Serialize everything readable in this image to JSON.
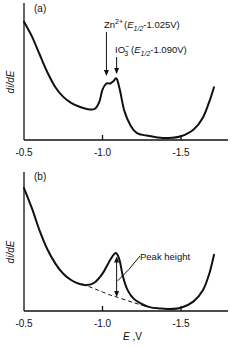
{
  "chart_data": [
    {
      "type": "line",
      "panel_label": "(a)",
      "title": "",
      "xlabel": "",
      "ylabel": "di/dE",
      "xlim": [
        -0.5,
        -1.75
      ],
      "ylim": [
        0,
        1
      ],
      "xticks": [
        -0.5,
        -1.0,
        -1.5
      ],
      "xtick_labels": [
        "-0.5",
        "-1.0",
        "-1.5"
      ],
      "grid": false,
      "series": [
        {
          "name": "differential pulse polarogram",
          "x": [
            -0.5,
            -0.55,
            -0.6,
            -0.65,
            -0.7,
            -0.75,
            -0.8,
            -0.85,
            -0.9,
            -0.95,
            -0.98,
            -1.0,
            -1.025,
            -1.05,
            -1.07,
            -1.09,
            -1.11,
            -1.14,
            -1.18,
            -1.22,
            -1.28,
            -1.35,
            -1.42,
            -1.5,
            -1.58,
            -1.64,
            -1.68,
            -1.71
          ],
          "y": [
            0.96,
            0.84,
            0.69,
            0.54,
            0.42,
            0.34,
            0.29,
            0.26,
            0.24,
            0.24,
            0.3,
            0.4,
            0.45,
            0.45,
            0.47,
            0.49,
            0.4,
            0.22,
            0.1,
            0.04,
            0.02,
            0.005,
            0.0,
            0.015,
            0.07,
            0.17,
            0.3,
            0.42
          ]
        }
      ],
      "annotations": [
        {
          "text": "Zn2+ (E1/2 -1.025 V)",
          "species": "Zn",
          "charge": "2+",
          "e_half": "-1.025",
          "x": -1.025
        },
        {
          "text": "IO3- (E1/2 -1.090 V)",
          "species": "IO",
          "subscript": "3",
          "charge": "−",
          "e_half": "-1.090",
          "x": -1.09
        }
      ]
    },
    {
      "type": "line",
      "panel_label": "(b)",
      "title": "",
      "xlabel": "E, V",
      "ylabel": "di/dE",
      "xlim": [
        -0.5,
        -1.75
      ],
      "ylim": [
        0,
        1
      ],
      "xticks": [
        -0.5,
        -1.0,
        -1.5
      ],
      "xtick_labels": [
        "-0.5",
        "-1.0",
        "-1.5"
      ],
      "grid": false,
      "series": [
        {
          "name": "polarogram",
          "style": "solid",
          "x": [
            -0.5,
            -0.55,
            -0.6,
            -0.65,
            -0.7,
            -0.75,
            -0.8,
            -0.85,
            -0.9,
            -0.95,
            -1.0,
            -1.04,
            -1.07,
            -1.09,
            -1.11,
            -1.13,
            -1.16,
            -1.2,
            -1.25,
            -1.3,
            -1.36,
            -1.42,
            -1.5,
            -1.58,
            -1.64,
            -1.68,
            -1.71
          ],
          "y": [
            0.96,
            0.8,
            0.62,
            0.47,
            0.36,
            0.28,
            0.23,
            0.2,
            0.19,
            0.21,
            0.28,
            0.37,
            0.43,
            0.44,
            0.38,
            0.26,
            0.15,
            0.08,
            0.04,
            0.015,
            0.005,
            0.0,
            0.01,
            0.06,
            0.15,
            0.28,
            0.43
          ]
        },
        {
          "name": "baseline",
          "style": "dashed",
          "x": [
            -0.87,
            -0.95,
            -1.0,
            -1.05,
            -1.09,
            -1.15,
            -1.2,
            -1.25,
            -1.3
          ],
          "y": [
            0.2,
            0.16,
            0.135,
            0.11,
            0.095,
            0.07,
            0.05,
            0.03,
            0.015
          ]
        }
      ],
      "annotations": [
        {
          "text": "Peak height",
          "x": -1.09,
          "from_y": 0.095,
          "to_y": 0.44
        }
      ]
    }
  ],
  "labels": {
    "panel_a": "(a)",
    "panel_b": "(b)",
    "ylabel_a": "di/dE",
    "ylabel_b": "di/dE",
    "xlabel_b": "E ,V",
    "zn_species": "Zn",
    "zn_charge": "2+",
    "zn_open": "(",
    "e_sym": "E",
    "half_sub": "1/2",
    "zn_value": "-1.025V)",
    "io_species": "IO",
    "io_sub": "3",
    "io_charge": "−",
    "io_value": "-1.090V)",
    "peak_height": "Peak height"
  }
}
